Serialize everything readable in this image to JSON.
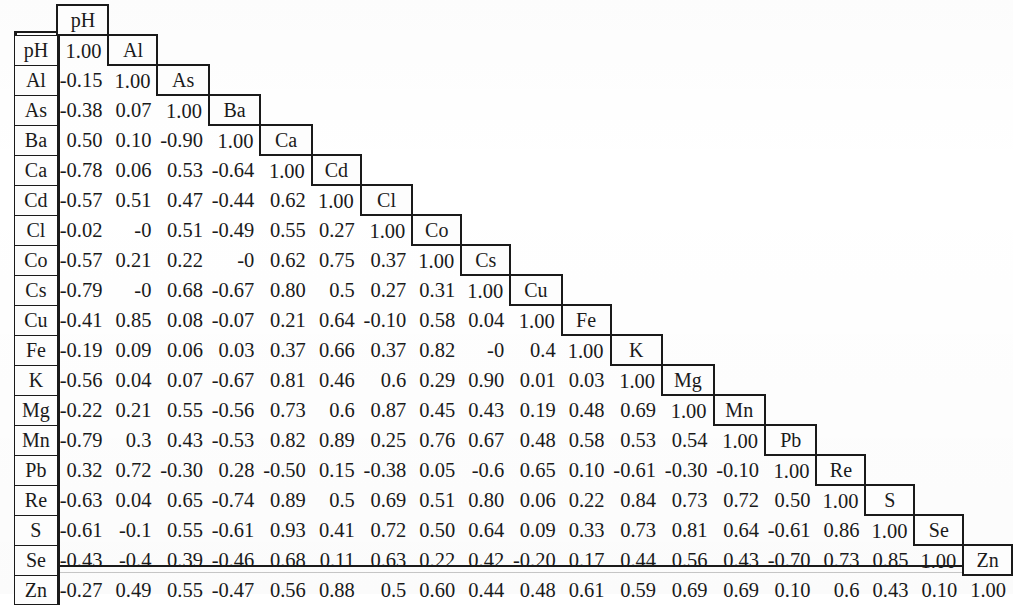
{
  "figure": {
    "type": "correlation-matrix",
    "title": "",
    "n_variables": 19,
    "diagonal_value": "1.00"
  },
  "chart_data": {
    "type": "table",
    "title": "",
    "subtitle": "",
    "xlabel": "",
    "ylabel": "",
    "layout": "lower-triangular with stair-step diagonal header boxes",
    "legend": "none",
    "grid": false,
    "variables": [
      "pH",
      "Al",
      "As",
      "Ba",
      "Ca",
      "Cd",
      "Cl",
      "Co",
      "Cs",
      "Cu",
      "Fe",
      "K",
      "Mg",
      "Mn",
      "Pb",
      "Re",
      "S",
      "Se",
      "Zn"
    ],
    "row_labels": [
      "pH",
      "Al",
      "As",
      "Ba",
      "Ca",
      "Cd",
      "Cl",
      "Co",
      "Cs",
      "Cu",
      "Fe",
      "K",
      "Mg",
      "Mn",
      "Pb",
      "Re",
      "S",
      "Se",
      "Zn"
    ],
    "column_labels": [
      "pH",
      "Al",
      "As",
      "Ba",
      "Ca",
      "Cd",
      "Cl",
      "Co",
      "Cs",
      "Cu",
      "Fe",
      "K",
      "Mg",
      "Mn",
      "Pb",
      "Re",
      "S",
      "Se",
      "Zn"
    ],
    "value_range": [
      -0.9,
      1.0
    ],
    "rows": [
      {
        "label": "pH",
        "values": [
          "1.00"
        ]
      },
      {
        "label": "Al",
        "values": [
          "-0.15",
          "1.00"
        ]
      },
      {
        "label": "As",
        "values": [
          "-0.38",
          "0.07",
          "1.00"
        ]
      },
      {
        "label": "Ba",
        "values": [
          "0.50",
          "0.10",
          "-0.90",
          "1.00"
        ]
      },
      {
        "label": "Ca",
        "values": [
          "-0.78",
          "0.06",
          "0.53",
          "-0.64",
          "1.00"
        ]
      },
      {
        "label": "Cd",
        "values": [
          "-0.57",
          "0.51",
          "0.47",
          "-0.44",
          "0.62",
          "1.00"
        ]
      },
      {
        "label": "Cl",
        "values": [
          "-0.02",
          "-0",
          "0.51",
          "-0.49",
          "0.55",
          "0.27",
          "1.00"
        ]
      },
      {
        "label": "Co",
        "values": [
          "-0.57",
          "0.21",
          "0.22",
          "-0",
          "0.62",
          "0.75",
          "0.37",
          "1.00"
        ]
      },
      {
        "label": "Cs",
        "values": [
          "-0.79",
          "-0",
          "0.68",
          "-0.67",
          "0.80",
          "0.5",
          "0.27",
          "0.31",
          "1.00"
        ]
      },
      {
        "label": "Cu",
        "values": [
          "-0.41",
          "0.85",
          "0.08",
          "-0.07",
          "0.21",
          "0.64",
          "-0.10",
          "0.58",
          "0.04",
          "1.00"
        ]
      },
      {
        "label": "Fe",
        "values": [
          "-0.19",
          "0.09",
          "0.06",
          "0.03",
          "0.37",
          "0.66",
          "0.37",
          "0.82",
          "-0",
          "0.4",
          "1.00"
        ]
      },
      {
        "label": "K",
        "values": [
          "-0.56",
          "0.04",
          "0.07",
          "-0.67",
          "0.81",
          "0.46",
          "0.6",
          "0.29",
          "0.90",
          "0.01",
          "0.03",
          "1.00"
        ]
      },
      {
        "label": "Mg",
        "values": [
          "-0.22",
          "0.21",
          "0.55",
          "-0.56",
          "0.73",
          "0.6",
          "0.87",
          "0.45",
          "0.43",
          "0.19",
          "0.48",
          "0.69",
          "1.00"
        ]
      },
      {
        "label": "Mn",
        "values": [
          "-0.79",
          "0.3",
          "0.43",
          "-0.53",
          "0.82",
          "0.89",
          "0.25",
          "0.76",
          "0.67",
          "0.48",
          "0.58",
          "0.53",
          "0.54",
          "1.00"
        ]
      },
      {
        "label": "Pb",
        "values": [
          "0.32",
          "0.72",
          "-0.30",
          "0.28",
          "-0.50",
          "0.15",
          "-0.38",
          "0.05",
          "-0.6",
          "0.65",
          "0.10",
          "-0.61",
          "-0.30",
          "-0.10",
          "1.00"
        ]
      },
      {
        "label": "Re",
        "values": [
          "-0.63",
          "0.04",
          "0.65",
          "-0.74",
          "0.89",
          "0.5",
          "0.69",
          "0.51",
          "0.80",
          "0.06",
          "0.22",
          "0.84",
          "0.73",
          "0.72",
          "0.50",
          "1.00"
        ]
      },
      {
        "label": "S",
        "values": [
          "-0.61",
          "-0.1",
          "0.55",
          "-0.61",
          "0.93",
          "0.41",
          "0.72",
          "0.50",
          "0.64",
          "0.09",
          "0.33",
          "0.73",
          "0.81",
          "0.64",
          "-0.61",
          "0.86",
          "1.00"
        ]
      },
      {
        "label": "Se",
        "values": [
          "-0.43",
          "-0.4",
          "0.39",
          "-0.46",
          "0.68",
          "0.11",
          "0.63",
          "0.22",
          "0.42",
          "-0.20",
          "0.17",
          "0.44",
          "0.56",
          "0.43",
          "-0.70",
          "0.73",
          "0.85",
          "1.00"
        ]
      },
      {
        "label": "Zn",
        "values": [
          "-0.27",
          "0.49",
          "0.55",
          "-0.47",
          "0.56",
          "0.88",
          "0.5",
          "0.60",
          "0.44",
          "0.48",
          "0.61",
          "0.59",
          "0.69",
          "0.69",
          "0.10",
          "0.6",
          "0.43",
          "0.10",
          "1.00"
        ]
      }
    ]
  },
  "colors": {
    "ink": "#1a1a1a",
    "paper": "#ffffff",
    "cell_fill": "#fdfdfd"
  }
}
